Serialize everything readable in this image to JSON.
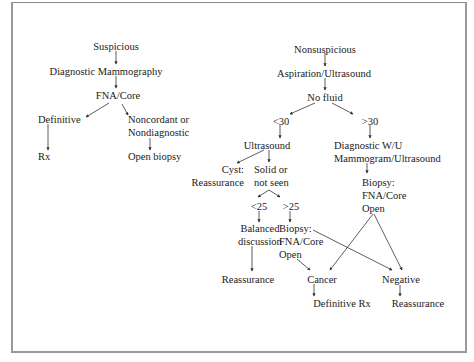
{
  "diagram": {
    "type": "flowchart",
    "left_branch": {
      "root": "Suspicious",
      "step1": "Diagnostic Mammography",
      "step2": "FNA/Core",
      "definitive": "Definitive",
      "rx": "Rx",
      "noncordant": [
        "Noncordant or",
        "Nondiagnostic"
      ],
      "open_biopsy": "Open biopsy"
    },
    "right_branch": {
      "root": "Nonsuspicious",
      "step1": "Aspiration/Ultrasound",
      "step2": "No fluid",
      "lt30": "<30",
      "gt30": ">30",
      "ultrasound": "Ultrasound",
      "diagnostic_wu": [
        "Diagnostic W/U",
        "Mammogram/Ultrasound"
      ],
      "cyst": [
        "Cyst:",
        "Reassurance"
      ],
      "solid": [
        "Solid or",
        "not seen"
      ],
      "lt25": "<25",
      "gt25": ">25",
      "balanced": [
        "Balanced",
        "discussion"
      ],
      "biopsy_mid": [
        "Biopsy:",
        "FNA/Core",
        "Open"
      ],
      "biopsy_right": [
        "Biopsy:",
        "FNA/Core",
        "Open"
      ],
      "reassurance_left": "Reassurance",
      "cancer": "Cancer",
      "negative": "Negative",
      "definitive_rx": "Definitive Rx",
      "reassurance_right": "Reassurance"
    },
    "colors": {
      "text": "#1a1a1a",
      "line": "#333333",
      "frame": "#9a9a9a",
      "background": "#ffffff"
    }
  }
}
